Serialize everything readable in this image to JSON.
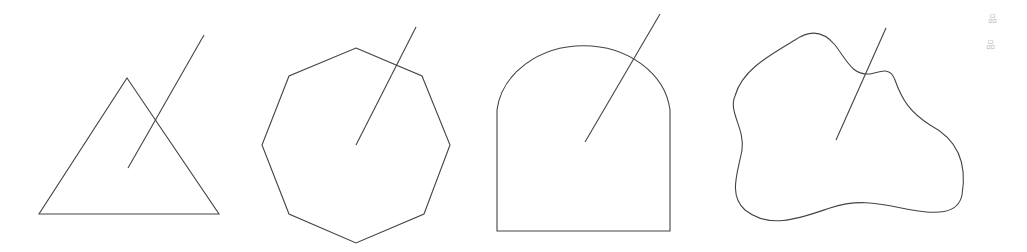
{
  "diagram": {
    "stroke_color": "#444444",
    "background": "#ffffff",
    "shapes": [
      {
        "name": "triangle",
        "points": "127,78 219,214 39,214",
        "ray": {
          "x1": 128,
          "y1": 168,
          "x2": 204,
          "y2": 35
        }
      },
      {
        "name": "octagon",
        "points": "356,48 422,76 450,145 424,214 356,243 289,214 262,145 289,76",
        "ray": {
          "x1": 356,
          "y1": 145,
          "x2": 416,
          "y2": 27
        }
      },
      {
        "name": "arch",
        "path": "M497,231 L497,110 A87,72 0 0 1 670,110 L670,231 Z",
        "ray": {
          "x1": 585,
          "y1": 142,
          "x2": 660,
          "y2": 14
        }
      },
      {
        "name": "blob",
        "path": "M735,96 C742,70 770,55 795,40 C812,28 825,33 835,45 C848,62 852,75 870,74 C880,72 890,66 895,80 C902,100 910,112 930,125 C955,138 968,160 962,195 C958,215 935,214 912,210 C880,204 860,198 830,208 C800,218 770,230 745,210 C728,195 738,172 742,150 C745,128 728,112 735,96 Z",
        "ray": {
          "x1": 836,
          "y1": 140,
          "x2": 886,
          "y2": 28
        }
      }
    ],
    "corner_marks": [
      "品",
      "品"
    ]
  }
}
